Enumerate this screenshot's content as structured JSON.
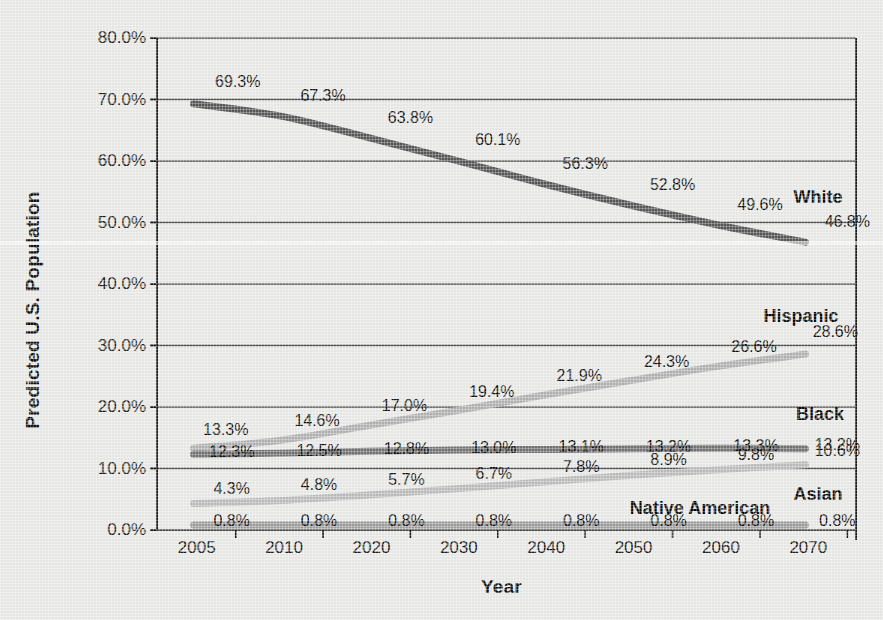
{
  "chart_data": {
    "type": "line",
    "title": "",
    "xlabel": "Year",
    "ylabel": "Predicted U.S. Population",
    "x": [
      "2005",
      "2010",
      "2020",
      "2030",
      "2040",
      "2050",
      "2060",
      "2070"
    ],
    "categories": [
      "2005",
      "2010",
      "2020",
      "2030",
      "2040",
      "2050",
      "2060",
      "2070"
    ],
    "xtick_labels": [
      "2005",
      "2010",
      "2020",
      "2030",
      "2040",
      "2050",
      "2060",
      "2070"
    ],
    "ytick_labels": [
      "0.0%",
      "10.0%",
      "20.0%",
      "30.0%",
      "40.0%",
      "50.0%",
      "60.0%",
      "70.0%",
      "80.0%"
    ],
    "ytick_values": [
      0,
      10,
      20,
      30,
      40,
      50,
      60,
      70,
      80
    ],
    "ylim": [
      0,
      80
    ],
    "yunit": "%",
    "grid": "horizontal",
    "legend": "inline-right-of-series",
    "series": [
      {
        "name": "White",
        "color": "#585858",
        "values": [
          69.3,
          67.3,
          63.8,
          60.1,
          56.3,
          52.8,
          49.6,
          46.8
        ],
        "labels": [
          "69.3%",
          "67.3%",
          "63.8%",
          "60.1%",
          "56.3%",
          "52.8%",
          "49.6%",
          "46.8%"
        ]
      },
      {
        "name": "Hispanic",
        "color": "#b3b3b3",
        "values": [
          13.3,
          14.6,
          17.0,
          19.4,
          21.9,
          24.3,
          26.6,
          28.6
        ],
        "labels": [
          "13.3%",
          "14.6%",
          "17.0%",
          "19.4%",
          "21.9%",
          "24.3%",
          "26.6%",
          "28.6%"
        ]
      },
      {
        "name": "Black",
        "color": "#737373",
        "values": [
          12.3,
          12.5,
          12.8,
          13.0,
          13.1,
          13.2,
          13.3,
          13.2
        ],
        "labels": [
          "12.3%",
          "12.5%",
          "12.8%",
          "13.0%",
          "13.1%",
          "13.2%",
          "13.3%",
          "13.2%"
        ]
      },
      {
        "name": "Asian",
        "color": "#bdbdbd",
        "values": [
          4.3,
          4.8,
          5.7,
          6.7,
          7.8,
          8.9,
          9.8,
          10.6
        ],
        "labels": [
          "4.3%",
          "4.8%",
          "5.7%",
          "6.7%",
          "7.8%",
          "8.9%",
          "9.8%",
          "10.6%"
        ]
      },
      {
        "name": "Native American",
        "color": "#9e9e9e",
        "values": [
          0.8,
          0.8,
          0.8,
          0.8,
          0.8,
          0.8,
          0.8,
          0.8
        ],
        "labels": [
          "0.8%",
          "0.8%",
          "0.8%",
          "0.8%",
          "0.8%",
          "0.8%",
          "0.8%",
          "0.8%"
        ]
      }
    ],
    "series_label_positions": [
      {
        "name": "White",
        "x": 818,
        "y": 197
      },
      {
        "name": "Hispanic",
        "x": 801,
        "y": 316
      },
      {
        "name": "Black",
        "x": 820,
        "y": 414
      },
      {
        "name": "Asian",
        "x": 818,
        "y": 494
      },
      {
        "name": "Native American",
        "x": 700,
        "y": 508
      }
    ],
    "colors": {
      "background": "#e9e9e7",
      "axis": "#1a1a1a",
      "grid": "#4d4d4d",
      "text": "#111111"
    }
  }
}
